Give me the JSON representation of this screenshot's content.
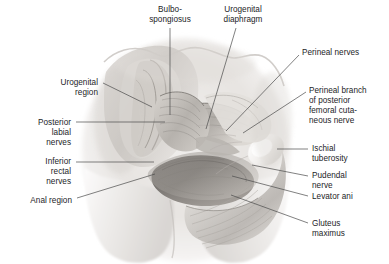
{
  "figure": {
    "type": "anatomical-illustration",
    "style": "grayscale medical illustration",
    "background_color": "#ffffff",
    "label_text_color": "#1d1d1f",
    "leader_line_color": "#4a4a4a"
  },
  "labels": [
    {
      "id": "bulbospongiosus",
      "text": "Bulbo-\nspongiosus",
      "align": "center",
      "x": 144,
      "y": 5,
      "w": 52,
      "leader": {
        "x1": 170,
        "y1": 28,
        "x2": 170,
        "y2": 115
      }
    },
    {
      "id": "urogenital-diaphragm",
      "text": "Urogenital\ndiaphragm",
      "align": "center",
      "x": 215,
      "y": 5,
      "w": 56,
      "leader": {
        "x1": 236,
        "y1": 28,
        "x2": 206,
        "y2": 129
      }
    },
    {
      "id": "perineal-nerves",
      "text": "Perineal nerves",
      "align": "left",
      "x": 302,
      "y": 48,
      "w": 82,
      "leader": {
        "x1": 299,
        "y1": 55,
        "x2": 226,
        "y2": 131
      }
    },
    {
      "id": "urogenital-region",
      "text": "Urogenital\nregion",
      "align": "right",
      "x": 16,
      "y": 78,
      "w": 82,
      "leader": {
        "x1": 103,
        "y1": 83,
        "x2": 152,
        "y2": 107
      }
    },
    {
      "id": "perineal-branch-posterior-femoral-cutaneous-nerve",
      "text": "Perineal branch\nof posterior\nfemoral cuta-\nneous nerve",
      "align": "left",
      "x": 309,
      "y": 86,
      "w": 78,
      "leader": {
        "x1": 306,
        "y1": 92,
        "x2": 243,
        "y2": 133
      }
    },
    {
      "id": "posterior-labial-nerves",
      "text": "Posterior\nlabial\nnerves",
      "align": "right",
      "x": 0,
      "y": 118,
      "w": 71,
      "leader": {
        "x1": 76,
        "y1": 122,
        "x2": 165,
        "y2": 122
      }
    },
    {
      "id": "ischial-tuberosity",
      "text": "Ischial\ntuberosity",
      "align": "left",
      "x": 312,
      "y": 144,
      "w": 74,
      "leader": {
        "x1": 308,
        "y1": 149,
        "x2": 277,
        "y2": 149
      }
    },
    {
      "id": "inferior-rectal-nerves",
      "text": "Inferior\nrectal\nnerves",
      "align": "right",
      "x": 0,
      "y": 157,
      "w": 71,
      "leader": {
        "x1": 76,
        "y1": 162,
        "x2": 154,
        "y2": 162
      }
    },
    {
      "id": "pudendal-nerve",
      "text": "Pudendal\nnerve",
      "align": "left",
      "x": 312,
      "y": 171,
      "w": 74,
      "leader": {
        "x1": 308,
        "y1": 176,
        "x2": 252,
        "y2": 165
      }
    },
    {
      "id": "levator-ani",
      "text": "Levator ani",
      "align": "left",
      "x": 312,
      "y": 192,
      "w": 74,
      "leader": {
        "x1": 308,
        "y1": 196,
        "x2": 232,
        "y2": 176
      }
    },
    {
      "id": "anal-region",
      "text": "Anal region",
      "align": "right",
      "x": 0,
      "y": 196,
      "w": 72,
      "leader": {
        "x1": 77,
        "y1": 198,
        "x2": 155,
        "y2": 174
      }
    },
    {
      "id": "gluteus-maximus",
      "text": "Gluteus\nmaximus",
      "align": "left",
      "x": 312,
      "y": 219,
      "w": 74,
      "leader": {
        "x1": 308,
        "y1": 223,
        "x2": 231,
        "y2": 195
      }
    }
  ]
}
